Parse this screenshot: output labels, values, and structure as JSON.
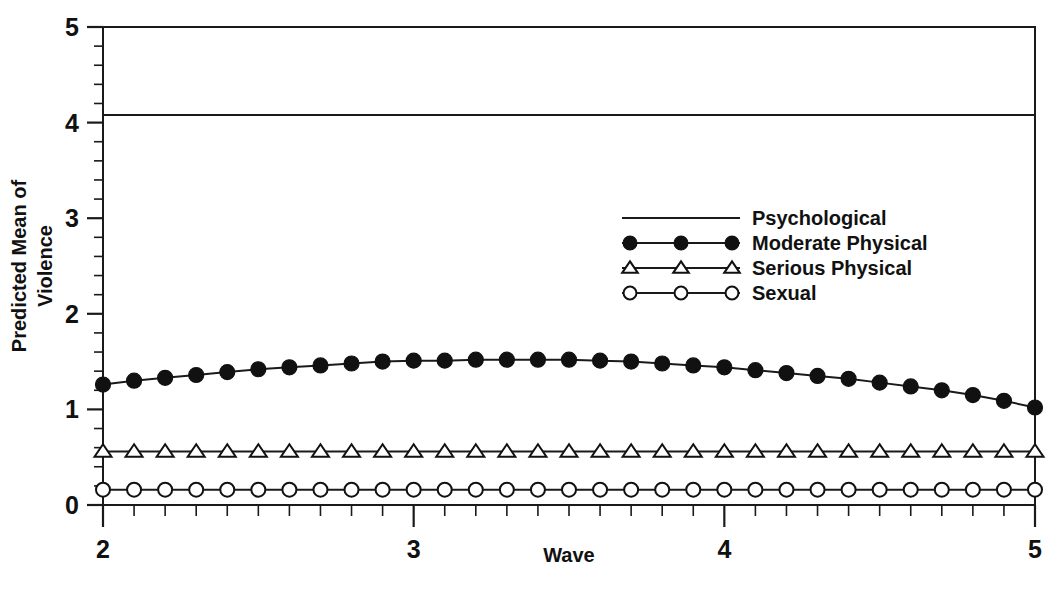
{
  "chart_data": {
    "type": "line",
    "title": "",
    "xlabel": "Wave",
    "ylabel": "Predicted Mean of Violence",
    "ylabel_lines": [
      "Predicted Mean of",
      "Violence"
    ],
    "xlim": [
      2,
      5
    ],
    "ylim": [
      0,
      5
    ],
    "xticks": [
      2,
      3,
      4,
      5
    ],
    "xtick_labels": [
      "2",
      "3",
      "4",
      "5"
    ],
    "yticks": [
      0,
      1,
      2,
      3,
      4,
      5
    ],
    "ytick_labels": [
      "0",
      "1",
      "2",
      "3",
      "4",
      "5"
    ],
    "x_minor_step": 0.1,
    "y_minor_step": 0.2,
    "grid": false,
    "legend_position": "upper center",
    "x": [
      2.0,
      2.1,
      2.2,
      2.3,
      2.4,
      2.5,
      2.6,
      2.7,
      2.8,
      2.9,
      3.0,
      3.1,
      3.2,
      3.3,
      3.4,
      3.5,
      3.6,
      3.7,
      3.8,
      3.9,
      4.0,
      4.1,
      4.2,
      4.3,
      4.4,
      4.5,
      4.6,
      4.7,
      4.8,
      4.9,
      5.0
    ],
    "series": [
      {
        "name": "Psychological",
        "marker": "none",
        "marker_fill": "none",
        "values": [
          4.08,
          4.08,
          4.08,
          4.08,
          4.08,
          4.08,
          4.08,
          4.08,
          4.08,
          4.08,
          4.08,
          4.08,
          4.08,
          4.08,
          4.08,
          4.08,
          4.08,
          4.08,
          4.08,
          4.08,
          4.08,
          4.08,
          4.08,
          4.08,
          4.08,
          4.08,
          4.08,
          4.08,
          4.08,
          4.08,
          4.08
        ]
      },
      {
        "name": "Moderate Physical",
        "marker": "circle",
        "marker_fill": "filled",
        "values": [
          1.26,
          1.3,
          1.33,
          1.36,
          1.39,
          1.42,
          1.44,
          1.46,
          1.48,
          1.5,
          1.51,
          1.51,
          1.52,
          1.52,
          1.52,
          1.52,
          1.51,
          1.5,
          1.48,
          1.46,
          1.44,
          1.41,
          1.38,
          1.35,
          1.32,
          1.28,
          1.24,
          1.2,
          1.15,
          1.09,
          1.02
        ]
      },
      {
        "name": "Serious Physical",
        "marker": "triangle",
        "marker_fill": "open",
        "values": [
          0.56,
          0.56,
          0.56,
          0.56,
          0.56,
          0.56,
          0.56,
          0.56,
          0.56,
          0.56,
          0.56,
          0.56,
          0.56,
          0.56,
          0.56,
          0.56,
          0.56,
          0.56,
          0.56,
          0.56,
          0.56,
          0.56,
          0.56,
          0.56,
          0.56,
          0.56,
          0.56,
          0.56,
          0.56,
          0.56,
          0.56
        ]
      },
      {
        "name": "Sexual",
        "marker": "circle",
        "marker_fill": "open",
        "values": [
          0.16,
          0.16,
          0.16,
          0.16,
          0.16,
          0.16,
          0.16,
          0.16,
          0.16,
          0.16,
          0.16,
          0.16,
          0.16,
          0.16,
          0.16,
          0.16,
          0.16,
          0.16,
          0.16,
          0.16,
          0.16,
          0.16,
          0.16,
          0.16,
          0.16,
          0.16,
          0.16,
          0.16,
          0.16,
          0.16,
          0.16
        ]
      }
    ],
    "legend_entries": [
      {
        "label": "Psychological",
        "marker": "none",
        "marker_fill": "none"
      },
      {
        "label": "Moderate Physical",
        "marker": "circle",
        "marker_fill": "filled"
      },
      {
        "label": "Serious Physical",
        "marker": "triangle",
        "marker_fill": "open"
      },
      {
        "label": "Sexual",
        "marker": "circle",
        "marker_fill": "open"
      }
    ],
    "colors": {
      "line": "#1a1a1a",
      "marker_fill": "#111111",
      "marker_open_fill": "#ffffff",
      "text": "#111111",
      "background": "#ffffff"
    }
  }
}
